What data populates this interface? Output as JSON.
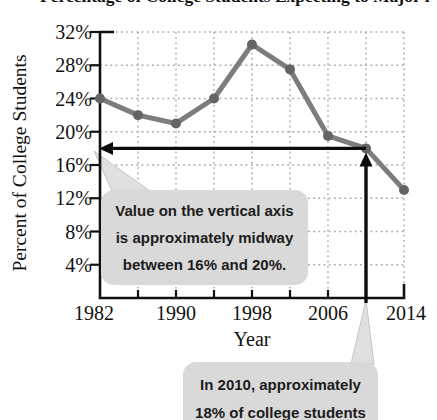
{
  "figure": {
    "clipped_title_text": "Percentage of College Students Expecting to Major in Business",
    "ylabel": "Percent of College Students",
    "xlabel": "Year"
  },
  "chart_data": {
    "type": "line",
    "x": [
      1982,
      1986,
      1990,
      1994,
      1998,
      2002,
      2006,
      2010,
      2014
    ],
    "values": [
      24,
      22,
      21,
      24,
      30.5,
      27.5,
      19.5,
      18,
      13
    ],
    "x_tick_labels": [
      "1982",
      "1990",
      "1998",
      "2006",
      "2014"
    ],
    "y_tick_labels": [
      "32%",
      "28%",
      "24%",
      "20%",
      "16%",
      "12%",
      "8%",
      "4%"
    ],
    "xlim": [
      1982,
      2014
    ],
    "ylim": [
      0,
      32
    ],
    "y_tick_step": 4,
    "x_tick_step": 4,
    "grid": "dotted",
    "legend": "none",
    "colors": {
      "line": "#7d7d7d",
      "marker": "#646464",
      "grid": "#a8a8a8",
      "axis": "#111111",
      "arrow": "#0d0d0d",
      "callout_bg": "#d9d9d9",
      "callout_tail": "#e0e0e0",
      "callout_tail_edge": "#c6c6c6"
    },
    "annotations": {
      "horizontal_arrow": {
        "from_year": 2010,
        "percent": 18,
        "points_to": "y-axis"
      },
      "vertical_arrow": {
        "year": 2010,
        "from": "x-axis",
        "to_percent": 18
      }
    }
  },
  "callouts": {
    "vertical_axis_note": {
      "line1": "Value on the vertical axis",
      "line2": "is approximately midway",
      "line3": "between 16% and 20%."
    },
    "year_2010_note": {
      "line1": "In 2010, approximately",
      "line2": "18% of college students"
    }
  }
}
